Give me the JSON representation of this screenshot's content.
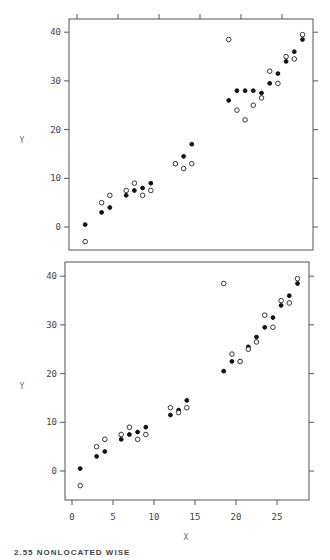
{
  "caption": "2.55    NONLOCATED WISE",
  "chart_data": [
    {
      "type": "scatter",
      "panel": "top",
      "title": "",
      "xlabel": "",
      "ylabel": "Y",
      "xlim": [
        -1.5,
        30
      ],
      "ylim": [
        -6,
        43
      ],
      "x_ticks": [
        "0",
        "5",
        "10",
        "15",
        "20",
        "25"
      ],
      "y_ticks": [
        "0",
        "10",
        "20",
        "30",
        "40"
      ],
      "x_ticks_position": "top",
      "grid": false,
      "series": [
        {
          "name": "filled",
          "marker": "filled-circle",
          "points": [
            [
              1,
              0.5
            ],
            [
              3,
              3
            ],
            [
              4,
              4
            ],
            [
              6,
              6.5
            ],
            [
              7,
              7.5
            ],
            [
              8,
              8
            ],
            [
              9,
              9
            ],
            [
              12,
              13
            ],
            [
              13,
              14.5
            ],
            [
              14,
              17
            ],
            [
              18.5,
              26
            ],
            [
              19.5,
              28
            ],
            [
              20.5,
              28
            ],
            [
              21.5,
              28
            ],
            [
              22.5,
              27.5
            ],
            [
              23.5,
              29.5
            ],
            [
              24.5,
              31.5
            ],
            [
              25.5,
              34
            ],
            [
              26.5,
              36
            ],
            [
              27.5,
              38.5
            ]
          ]
        },
        {
          "name": "open",
          "marker": "open-circle",
          "points": [
            [
              1,
              -3
            ],
            [
              3,
              5
            ],
            [
              4,
              6.5
            ],
            [
              6,
              7.5
            ],
            [
              7,
              9
            ],
            [
              8,
              6.5
            ],
            [
              9,
              7.5
            ],
            [
              12,
              13
            ],
            [
              13,
              12
            ],
            [
              14,
              13
            ],
            [
              18.5,
              38.5
            ],
            [
              19.5,
              24
            ],
            [
              20.5,
              22
            ],
            [
              21.5,
              25
            ],
            [
              22.5,
              26.5
            ],
            [
              23.5,
              32
            ],
            [
              24.5,
              29.5
            ],
            [
              25.5,
              35
            ],
            [
              26.5,
              34.5
            ],
            [
              27.5,
              39.5
            ]
          ]
        }
      ]
    },
    {
      "type": "scatter",
      "panel": "bottom",
      "title": "",
      "xlabel": "X",
      "ylabel": "Y",
      "xlim": [
        -1.5,
        30
      ],
      "ylim": [
        -6,
        43
      ],
      "x_ticks": [
        "0",
        "5",
        "10",
        "15",
        "20",
        "25"
      ],
      "y_ticks": [
        "0",
        "10",
        "20",
        "30",
        "40"
      ],
      "x_ticks_position": "bottom",
      "grid": false,
      "series": [
        {
          "name": "filled",
          "marker": "filled-circle",
          "points": [
            [
              1,
              0.5
            ],
            [
              3,
              3
            ],
            [
              4,
              4
            ],
            [
              6,
              6.5
            ],
            [
              7,
              7.5
            ],
            [
              8,
              8
            ],
            [
              9,
              9
            ],
            [
              12,
              11.5
            ],
            [
              13,
              12.5
            ],
            [
              14,
              14.5
            ],
            [
              18.5,
              20.5
            ],
            [
              19.5,
              22.5
            ],
            [
              20.5,
              22.5
            ],
            [
              21.5,
              25.5
            ],
            [
              22.5,
              27.5
            ],
            [
              23.5,
              29.5
            ],
            [
              24.5,
              31.5
            ],
            [
              25.5,
              34
            ],
            [
              26.5,
              36
            ],
            [
              27.5,
              38.5
            ]
          ]
        },
        {
          "name": "open",
          "marker": "open-circle",
          "points": [
            [
              1,
              -3
            ],
            [
              3,
              5
            ],
            [
              4,
              6.5
            ],
            [
              6,
              7.5
            ],
            [
              7,
              9
            ],
            [
              8,
              6.5
            ],
            [
              9,
              7.5
            ],
            [
              12,
              13
            ],
            [
              13,
              12
            ],
            [
              14,
              13
            ],
            [
              18.5,
              38.5
            ],
            [
              19.5,
              24
            ],
            [
              20.5,
              22.5
            ],
            [
              21.5,
              25
            ],
            [
              22.5,
              26.5
            ],
            [
              23.5,
              32
            ],
            [
              24.5,
              29.5
            ],
            [
              25.5,
              35
            ],
            [
              26.5,
              34.5
            ],
            [
              27.5,
              39.5
            ]
          ]
        }
      ]
    }
  ]
}
